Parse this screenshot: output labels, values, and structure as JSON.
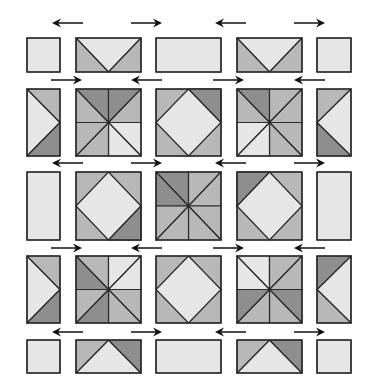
{
  "diagram": {
    "colors": {
      "light": "#e6e6e6",
      "medium": "#b8b8b8",
      "dark": "#8e8e8e",
      "outline": "#2a2a2a",
      "arrow": "#111111"
    },
    "columns_x": [
      [
        27,
        60
      ],
      [
        76,
        141
      ],
      [
        156,
        221
      ],
      [
        237,
        302
      ],
      [
        317,
        351
      ]
    ],
    "rows_y": [
      [
        38,
        72
      ],
      [
        89,
        156
      ],
      [
        172,
        240
      ],
      [
        256,
        323
      ],
      [
        340,
        373
      ]
    ],
    "arrow_rows_y": [
      23,
      80,
      164,
      248,
      332
    ],
    "arrow_positions": [
      {
        "y": 23,
        "arrows": [
          {
            "x1": 83,
            "x2": 52,
            "dir": "left"
          },
          {
            "x1": 131,
            "x2": 162,
            "dir": "right"
          },
          {
            "x1": 246,
            "x2": 215,
            "dir": "left"
          },
          {
            "x1": 294,
            "x2": 325,
            "dir": "right"
          }
        ]
      },
      {
        "y": 80,
        "arrows": [
          {
            "x1": 51,
            "x2": 82,
            "dir": "right"
          },
          {
            "x1": 162,
            "x2": 131,
            "dir": "left"
          },
          {
            "x1": 213,
            "x2": 244,
            "dir": "right"
          },
          {
            "x1": 325,
            "x2": 294,
            "dir": "left"
          }
        ]
      },
      {
        "y": 163,
        "arrows": [
          {
            "x1": 83,
            "x2": 52,
            "dir": "left"
          },
          {
            "x1": 131,
            "x2": 162,
            "dir": "right"
          },
          {
            "x1": 246,
            "x2": 215,
            "dir": "left"
          },
          {
            "x1": 294,
            "x2": 325,
            "dir": "right"
          }
        ]
      },
      {
        "y": 248,
        "arrows": [
          {
            "x1": 51,
            "x2": 82,
            "dir": "right"
          },
          {
            "x1": 162,
            "x2": 131,
            "dir": "left"
          },
          {
            "x1": 213,
            "x2": 244,
            "dir": "right"
          },
          {
            "x1": 325,
            "x2": 294,
            "dir": "left"
          }
        ]
      },
      {
        "y": 332,
        "arrows": [
          {
            "x1": 83,
            "x2": 52,
            "dir": "left"
          },
          {
            "x1": 131,
            "x2": 162,
            "dir": "right"
          },
          {
            "x1": 246,
            "x2": 215,
            "dir": "left"
          },
          {
            "x1": 294,
            "x2": 325,
            "dir": "right"
          }
        ]
      }
    ],
    "blocks": [
      {
        "row": 0,
        "col": 0,
        "type": "plain"
      },
      {
        "row": 0,
        "col": 1,
        "type": "flying-geese-down"
      },
      {
        "row": 0,
        "col": 2,
        "type": "plain"
      },
      {
        "row": 0,
        "col": 3,
        "type": "flying-geese-down"
      },
      {
        "row": 0,
        "col": 4,
        "type": "plain"
      },
      {
        "row": 1,
        "col": 0,
        "type": "side-triangle-right"
      },
      {
        "row": 1,
        "col": 1,
        "type": "pinwheel-a"
      },
      {
        "row": 1,
        "col": 2,
        "type": "square-in-square"
      },
      {
        "row": 1,
        "col": 3,
        "type": "pinwheel-b"
      },
      {
        "row": 1,
        "col": 4,
        "type": "side-triangle-left"
      },
      {
        "row": 2,
        "col": 0,
        "type": "plain"
      },
      {
        "row": 2,
        "col": 1,
        "type": "square-in-square"
      },
      {
        "row": 2,
        "col": 2,
        "type": "pinwheel-c"
      },
      {
        "row": 2,
        "col": 3,
        "type": "square-in-square"
      },
      {
        "row": 2,
        "col": 4,
        "type": "plain"
      },
      {
        "row": 3,
        "col": 0,
        "type": "side-triangle-right"
      },
      {
        "row": 3,
        "col": 1,
        "type": "pinwheel-d"
      },
      {
        "row": 3,
        "col": 2,
        "type": "square-in-square"
      },
      {
        "row": 3,
        "col": 3,
        "type": "pinwheel-e"
      },
      {
        "row": 3,
        "col": 4,
        "type": "side-triangle-left-dark"
      },
      {
        "row": 4,
        "col": 0,
        "type": "plain"
      },
      {
        "row": 4,
        "col": 1,
        "type": "flying-geese-up"
      },
      {
        "row": 4,
        "col": 2,
        "type": "plain"
      },
      {
        "row": 4,
        "col": 3,
        "type": "flying-geese-up"
      },
      {
        "row": 4,
        "col": 4,
        "type": "plain"
      }
    ]
  }
}
